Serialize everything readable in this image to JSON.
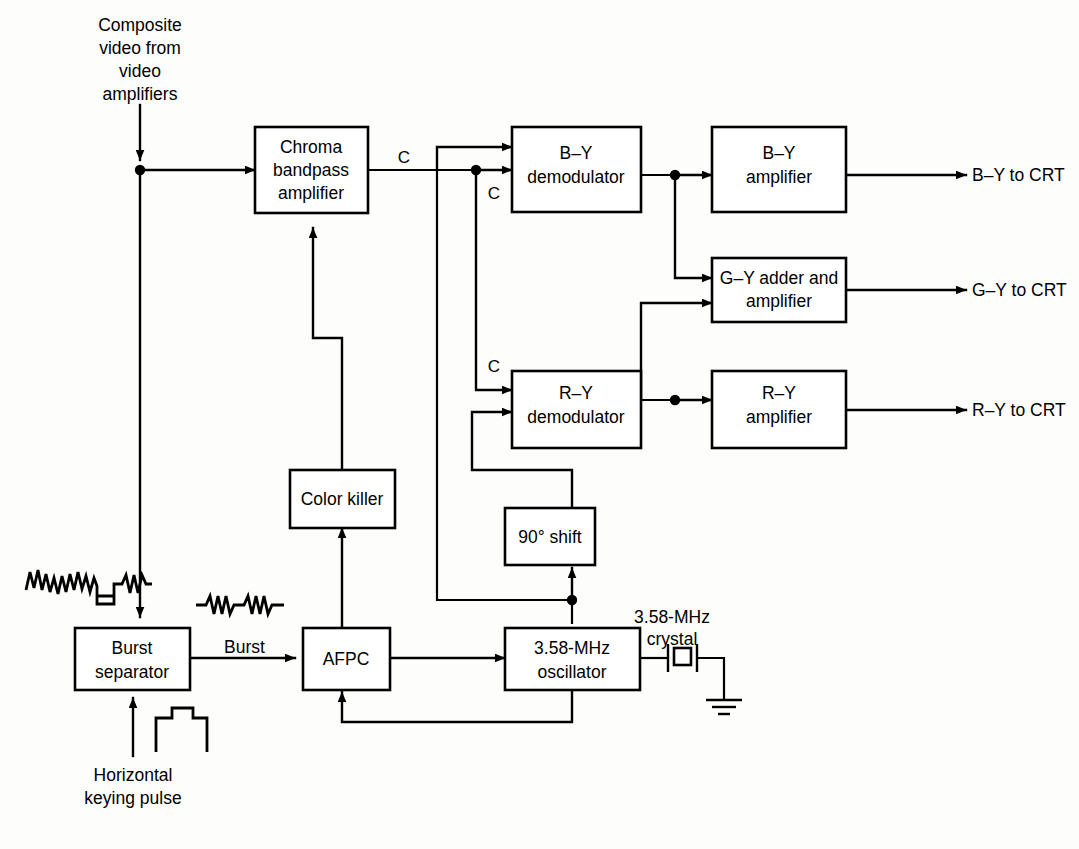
{
  "diagram": {
    "accent_color": "#000000",
    "background_color": "#fdfdfb"
  },
  "blocks": {
    "chroma_bandpass": {
      "line1": "Chroma",
      "line2": "bandpass",
      "line3": "amplifier"
    },
    "by_demodulator": {
      "line1": "B–Y",
      "line2": "demodulator"
    },
    "by_amplifier": {
      "line1": "B–Y",
      "line2": "amplifier"
    },
    "gy_adder": {
      "line1": "G–Y adder and",
      "line2": "amplifier"
    },
    "ry_demodulator": {
      "line1": "R–Y",
      "line2": "demodulator"
    },
    "ry_amplifier": {
      "line1": "R–Y",
      "line2": "amplifier"
    },
    "color_killer": {
      "line1": "Color killer"
    },
    "phase_shift": {
      "line1": "90° shift"
    },
    "burst_separator": {
      "line1": "Burst",
      "line2": "separator"
    },
    "afpc": {
      "line1": "AFPC"
    },
    "oscillator": {
      "line1": "3.58-MHz",
      "line2": "oscillator"
    }
  },
  "labels": {
    "input_composite": {
      "line1": "Composite",
      "line2": "video from",
      "line3": "video",
      "line4": "amplifiers"
    },
    "input_keying": {
      "line1": "Horizontal",
      "line2": "keying pulse"
    },
    "crystal": {
      "line1": "3.58-MHz",
      "line2": "crystal"
    },
    "signal_c_top": "C",
    "signal_c_by": "C",
    "signal_c_ry": "C",
    "signal_burst": "Burst",
    "output_by": "B–Y to CRT",
    "output_gy": "G–Y to CRT",
    "output_ry": "R–Y to CRT"
  },
  "waveforms": {
    "composite_video": "composite-video-waveform",
    "burst_pair": "burst-waveform",
    "keying_pulse": "keying-pulse-waveform",
    "crystal_symbol": "crystal-symbol",
    "ground_symbol": "ground-symbol"
  }
}
